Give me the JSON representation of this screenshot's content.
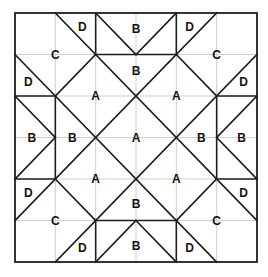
{
  "diagram": {
    "type": "quilt-block-piece-layout",
    "grid": {
      "columns": 6,
      "rows": 6
    },
    "colors": {
      "background": "#ffffff",
      "seam_lines": "#1e1e1e",
      "grid_lines": "#cfcfcf",
      "labels": "#111111"
    },
    "pixel_frame": {
      "left": 15,
      "top": 13,
      "right": 257,
      "bottom": 262
    },
    "seams": [
      {
        "name": "main-diagonal-1",
        "from": [
          1,
          0
        ],
        "to": [
          6,
          5
        ]
      },
      {
        "name": "main-diagonal-2",
        "from": [
          0,
          1
        ],
        "to": [
          5,
          6
        ]
      },
      {
        "name": "main-diagonal-3",
        "from": [
          5,
          0
        ],
        "to": [
          0,
          5
        ]
      },
      {
        "name": "main-diagonal-4",
        "from": [
          6,
          1
        ],
        "to": [
          1,
          6
        ]
      },
      {
        "name": "short-diagonal-top-left",
        "from": [
          2,
          1
        ],
        "to": [
          1,
          2
        ]
      },
      {
        "name": "short-diagonal-top-right",
        "from": [
          4,
          1
        ],
        "to": [
          5,
          2
        ]
      },
      {
        "name": "short-diagonal-bottom-left",
        "from": [
          1,
          4
        ],
        "to": [
          2,
          5
        ]
      },
      {
        "name": "short-diagonal-bottom-right",
        "from": [
          5,
          4
        ],
        "to": [
          4,
          5
        ]
      },
      {
        "name": "top-v-left",
        "from": [
          2,
          0
        ],
        "to": [
          3,
          1
        ]
      },
      {
        "name": "top-v-right",
        "from": [
          3,
          1
        ],
        "to": [
          4,
          0
        ]
      },
      {
        "name": "top-vertical-left",
        "from": [
          2,
          0
        ],
        "to": [
          2,
          1
        ]
      },
      {
        "name": "top-vertical-right",
        "from": [
          4,
          0
        ],
        "to": [
          4,
          1
        ]
      },
      {
        "name": "top-horizontal",
        "from": [
          2,
          1
        ],
        "to": [
          4,
          1
        ]
      },
      {
        "name": "bottom-v-left",
        "from": [
          2,
          6
        ],
        "to": [
          3,
          5
        ]
      },
      {
        "name": "bottom-v-right",
        "from": [
          3,
          5
        ],
        "to": [
          4,
          6
        ]
      },
      {
        "name": "bottom-vertical-left",
        "from": [
          2,
          5
        ],
        "to": [
          2,
          6
        ]
      },
      {
        "name": "bottom-vertical-right",
        "from": [
          4,
          5
        ],
        "to": [
          4,
          6
        ]
      },
      {
        "name": "bottom-horizontal",
        "from": [
          2,
          5
        ],
        "to": [
          4,
          5
        ]
      },
      {
        "name": "left-v-top",
        "from": [
          0,
          2
        ],
        "to": [
          1,
          3
        ]
      },
      {
        "name": "left-v-bottom",
        "from": [
          1,
          3
        ],
        "to": [
          0,
          4
        ]
      },
      {
        "name": "left-horizontal-top",
        "from": [
          0,
          2
        ],
        "to": [
          1,
          2
        ]
      },
      {
        "name": "left-horizontal-bottom",
        "from": [
          0,
          4
        ],
        "to": [
          1,
          4
        ]
      },
      {
        "name": "left-vertical",
        "from": [
          1,
          2
        ],
        "to": [
          1,
          4
        ]
      },
      {
        "name": "right-v-top",
        "from": [
          6,
          2
        ],
        "to": [
          5,
          3
        ]
      },
      {
        "name": "right-v-bottom",
        "from": [
          5,
          3
        ],
        "to": [
          6,
          4
        ]
      },
      {
        "name": "right-horizontal-top",
        "from": [
          5,
          2
        ],
        "to": [
          6,
          2
        ]
      },
      {
        "name": "right-horizontal-bottom",
        "from": [
          5,
          4
        ],
        "to": [
          6,
          4
        ]
      },
      {
        "name": "right-vertical",
        "from": [
          5,
          2
        ],
        "to": [
          5,
          4
        ]
      }
    ],
    "labels": [
      {
        "text": "C",
        "at": [
          1,
          1
        ]
      },
      {
        "text": "C",
        "at": [
          5,
          1
        ]
      },
      {
        "text": "C",
        "at": [
          1,
          5
        ]
      },
      {
        "text": "C",
        "at": [
          5,
          5
        ]
      },
      {
        "text": "D",
        "at": [
          1.67,
          0.33
        ]
      },
      {
        "text": "D",
        "at": [
          4.33,
          0.33
        ]
      },
      {
        "text": "D",
        "at": [
          0.33,
          1.67
        ]
      },
      {
        "text": "D",
        "at": [
          5.67,
          1.67
        ]
      },
      {
        "text": "D",
        "at": [
          0.33,
          4.33
        ]
      },
      {
        "text": "D",
        "at": [
          5.67,
          4.33
        ]
      },
      {
        "text": "D",
        "at": [
          1.67,
          5.67
        ]
      },
      {
        "text": "D",
        "at": [
          4.33,
          5.67
        ]
      },
      {
        "text": "B",
        "at": [
          3,
          0.38
        ]
      },
      {
        "text": "B",
        "at": [
          3,
          1.4
        ]
      },
      {
        "text": "B",
        "at": [
          0.42,
          3
        ]
      },
      {
        "text": "B",
        "at": [
          1.42,
          3
        ]
      },
      {
        "text": "B",
        "at": [
          4.62,
          3
        ]
      },
      {
        "text": "B",
        "at": [
          5.62,
          3
        ]
      },
      {
        "text": "B",
        "at": [
          3,
          4.6
        ]
      },
      {
        "text": "B",
        "at": [
          3,
          5.62
        ]
      },
      {
        "text": "A",
        "at": [
          2,
          2
        ]
      },
      {
        "text": "A",
        "at": [
          4,
          2
        ]
      },
      {
        "text": "A",
        "at": [
          3,
          3
        ]
      },
      {
        "text": "A",
        "at": [
          2,
          4
        ]
      },
      {
        "text": "A",
        "at": [
          4,
          4
        ]
      }
    ],
    "piece_types": [
      "A",
      "B",
      "C",
      "D"
    ]
  }
}
